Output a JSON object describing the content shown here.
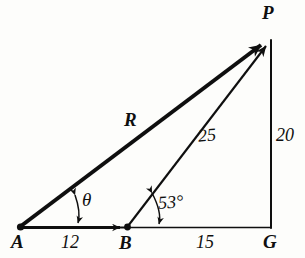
{
  "figure": {
    "background_color": "#fdfdfb",
    "ink_color": "#0f0f0f"
  },
  "vertices": [
    {
      "id": "A",
      "label": "A",
      "x": 20,
      "y": 227,
      "label_x": 11,
      "label_y": 232,
      "has_dot": true
    },
    {
      "id": "B",
      "label": "B",
      "x": 127,
      "y": 227,
      "label_x": 119,
      "label_y": 233,
      "has_dot": true
    },
    {
      "id": "G",
      "label": "G",
      "x": 270,
      "y": 227,
      "label_x": 263,
      "label_y": 232,
      "has_dot": false
    },
    {
      "id": "P",
      "label": "P",
      "x": 271,
      "y": 38,
      "label_x": 262,
      "label_y": 3,
      "has_dot": false
    }
  ],
  "vectors": [
    {
      "id": "R",
      "label": "R",
      "from": "A",
      "to": "P",
      "style": "thick",
      "arrowhead": "end",
      "label_x": 124,
      "label_y": 110
    },
    {
      "id": "BP",
      "label": "25",
      "from": "B",
      "to": "P",
      "style": "thin",
      "arrowhead": "end",
      "label_x": 198,
      "label_y": 126
    },
    {
      "id": "AB",
      "label": "12",
      "from": "A",
      "to": "B",
      "style": "thick",
      "arrowhead": "mid-end",
      "label_x": 61,
      "label_y": 233
    }
  ],
  "segments": [
    {
      "id": "BG",
      "label": "15",
      "from": "B",
      "to": "G",
      "style": "thin",
      "label_x": 196,
      "label_y": 233
    },
    {
      "id": "PG",
      "label": "20",
      "from": "P",
      "to": "G",
      "style": "thin",
      "label_x": 276,
      "label_y": 126
    }
  ],
  "angles": [
    {
      "id": "theta",
      "label": "θ",
      "at_vertex": "A",
      "between": "R and AB",
      "label_x": 82,
      "label_y": 190,
      "arc_arrow": "double"
    },
    {
      "id": "fifty-three",
      "label": "53°",
      "at_vertex": "B",
      "between": "BP and BG",
      "label_x": 158,
      "label_y": 193,
      "arc_arrow": "double"
    }
  ]
}
